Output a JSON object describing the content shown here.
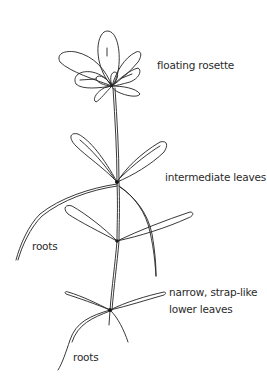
{
  "diagram": {
    "type": "botanical line drawing",
    "stroke_color": "#222222",
    "background": "#ffffff",
    "labels": {
      "rosette": "floating rosette",
      "intermediate": "intermediate leaves",
      "roots_upper": "roots",
      "lower_line1": "narrow, strap-like",
      "lower_line2": "lower leaves",
      "roots_lower": "roots"
    }
  }
}
